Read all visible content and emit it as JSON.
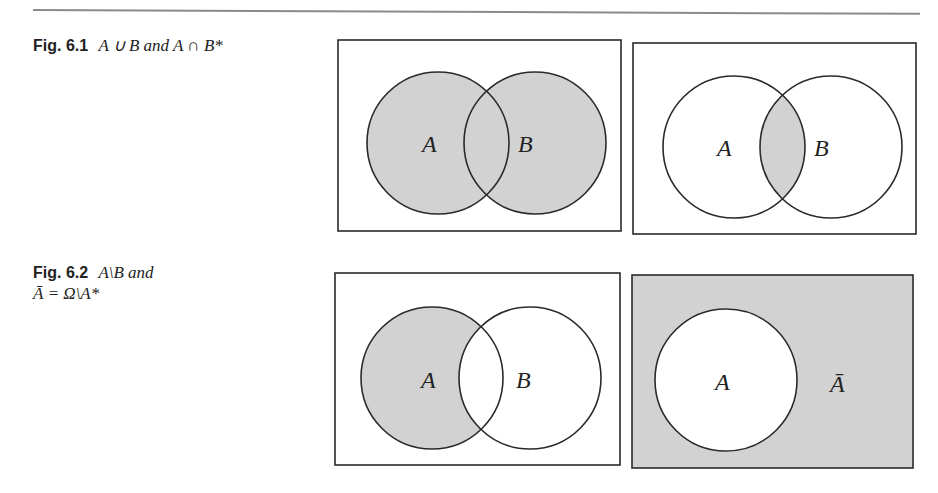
{
  "figures": [
    {
      "label": "Fig. 6.1",
      "caption_line1": "A ∪ B and A ∩ B*",
      "caption_line2": "",
      "panels": [
        {
          "name": "union",
          "set_labels": [
            "A",
            "B"
          ],
          "shaded": "A ∪ B"
        },
        {
          "name": "intersection",
          "set_labels": [
            "A",
            "B"
          ],
          "shaded": "A ∩ B"
        }
      ]
    },
    {
      "label": "Fig. 6.2",
      "caption_line1": "A\\B and",
      "caption_line2": "Ā = Ω\\A*",
      "panels": [
        {
          "name": "difference",
          "set_labels": [
            "A",
            "B"
          ],
          "shaded": "A \\ B"
        },
        {
          "name": "complement",
          "set_labels": [
            "A",
            "Ā"
          ],
          "shaded": "Ω \\ A"
        }
      ]
    }
  ],
  "colors": {
    "shade": "#d2d2d2",
    "stroke": "#2a2a2a",
    "rule": "#8a8a8a"
  }
}
